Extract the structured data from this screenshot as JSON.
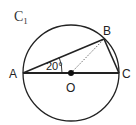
{
  "diagram": {
    "title": "C",
    "title_subscript": "1",
    "points": {
      "A": "A",
      "B": "B",
      "C": "C",
      "O": "O"
    },
    "angle_label": "20°",
    "colors": {
      "stroke": "#222222",
      "background": "#ffffff"
    }
  }
}
